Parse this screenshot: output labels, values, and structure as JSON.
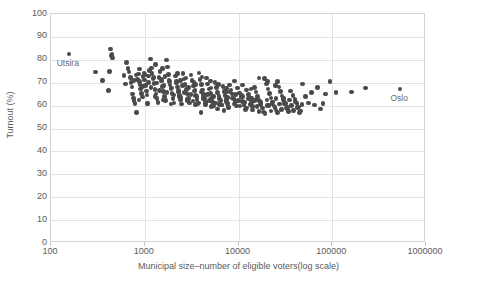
{
  "chart_data": {
    "type": "scatter",
    "title": "",
    "xlabel": "Municipal size–number of eligible voters(log scale)",
    "ylabel": "Turnout (%)",
    "xscale": "log",
    "yscale": "linear",
    "xlim": [
      100,
      1000000
    ],
    "ylim": [
      0,
      100
    ],
    "grid": true,
    "legend": null,
    "xticks": [
      100,
      1000,
      10000,
      100000,
      1000000
    ],
    "xtick_labels": [
      "100",
      "1000",
      "10000",
      "100000",
      "1000000"
    ],
    "yticks": [
      0,
      10,
      20,
      30,
      40,
      50,
      60,
      70,
      80,
      90,
      100
    ],
    "ytick_labels": [
      "0",
      "10",
      "20",
      "30",
      "40",
      "50",
      "60",
      "70",
      "80",
      "90",
      "100"
    ],
    "marker_color": "#4a4a4a",
    "marker_size": 4.6,
    "annotations": [
      {
        "text": "Utsira",
        "x": 155,
        "y": 82.5,
        "label_dx": 0,
        "label_dy": -9
      },
      {
        "text": "Oslo",
        "x": 530000,
        "y": 67.3,
        "label_dx": 0,
        "label_dy": -9
      }
    ],
    "series": [
      {
        "name": "Norwegian municipalities",
        "points": [
          [
            155,
            82.5
          ],
          [
            300,
            74.7
          ],
          [
            355,
            70.9
          ],
          [
            408,
            66.6
          ],
          [
            420,
            74.9
          ],
          [
            430,
            84.8
          ],
          [
            440,
            81.9
          ],
          [
            448,
            82.6
          ],
          [
            455,
            80.8
          ],
          [
            600,
            73.1
          ],
          [
            625,
            69.5
          ],
          [
            640,
            78.8
          ],
          [
            660,
            76.1
          ],
          [
            680,
            74.6
          ],
          [
            700,
            72.3
          ],
          [
            715,
            70.2
          ],
          [
            730,
            68.1
          ],
          [
            745,
            65.0
          ],
          [
            760,
            63.4
          ],
          [
            770,
            62.1
          ],
          [
            790,
            60.9
          ],
          [
            820,
            57.1
          ],
          [
            840,
            71.5
          ],
          [
            860,
            73.8
          ],
          [
            875,
            75.9
          ],
          [
            890,
            69.3
          ],
          [
            905,
            67.2
          ],
          [
            920,
            65.4
          ],
          [
            940,
            63.8
          ],
          [
            960,
            72.6
          ],
          [
            980,
            74.3
          ],
          [
            1000,
            71.1
          ],
          [
            1020,
            68.9
          ],
          [
            1040,
            66.3
          ],
          [
            1060,
            64.7
          ],
          [
            1080,
            61.0
          ],
          [
            1100,
            73.0
          ],
          [
            1120,
            75.2
          ],
          [
            1150,
            80.3
          ],
          [
            1180,
            76.4
          ],
          [
            1200,
            74.0
          ],
          [
            1230,
            71.8
          ],
          [
            1260,
            69.6
          ],
          [
            1290,
            67.0
          ],
          [
            1320,
            65.1
          ],
          [
            1350,
            63.2
          ],
          [
            1380,
            61.4
          ],
          [
            1420,
            72.2
          ],
          [
            1460,
            74.8
          ],
          [
            1500,
            70.7
          ],
          [
            1540,
            68.3
          ],
          [
            1580,
            66.1
          ],
          [
            1620,
            64.0
          ],
          [
            1660,
            62.3
          ],
          [
            1700,
            79.9
          ],
          [
            1740,
            76.8
          ],
          [
            1780,
            73.5
          ],
          [
            1820,
            71.2
          ],
          [
            1860,
            69.0
          ],
          [
            1900,
            67.3
          ],
          [
            1950,
            65.2
          ],
          [
            2000,
            63.0
          ],
          [
            2060,
            61.1
          ],
          [
            2120,
            72.9
          ],
          [
            2180,
            70.4
          ],
          [
            2240,
            68.2
          ],
          [
            2300,
            66.0
          ],
          [
            2360,
            64.3
          ],
          [
            2420,
            62.5
          ],
          [
            2480,
            60.7
          ],
          [
            2550,
            74.1
          ],
          [
            2620,
            71.6
          ],
          [
            2700,
            69.2
          ],
          [
            2780,
            67.1
          ],
          [
            2860,
            65.0
          ],
          [
            2940,
            63.1
          ],
          [
            3020,
            61.2
          ],
          [
            3100,
            73.3
          ],
          [
            3200,
            70.9
          ],
          [
            3300,
            68.5
          ],
          [
            3400,
            66.4
          ],
          [
            3500,
            64.5
          ],
          [
            3600,
            62.7
          ],
          [
            3700,
            60.9
          ],
          [
            3800,
            74.2
          ],
          [
            3900,
            71.3
          ],
          [
            4000,
            57.0
          ],
          [
            4050,
            69.1
          ],
          [
            4150,
            66.8
          ],
          [
            4250,
            64.9
          ],
          [
            4350,
            63.0
          ],
          [
            4450,
            61.3
          ],
          [
            4550,
            72.0
          ],
          [
            4700,
            69.4
          ],
          [
            4850,
            67.2
          ],
          [
            5000,
            65.3
          ],
          [
            5150,
            63.4
          ],
          [
            5300,
            61.6
          ],
          [
            5450,
            59.9
          ],
          [
            5600,
            70.1
          ],
          [
            5800,
            67.9
          ],
          [
            6000,
            65.8
          ],
          [
            6200,
            63.9
          ],
          [
            6400,
            62.1
          ],
          [
            6600,
            60.3
          ],
          [
            6800,
            68.3
          ],
          [
            7000,
            66.2
          ],
          [
            7200,
            64.4
          ],
          [
            7400,
            62.6
          ],
          [
            7600,
            60.8
          ],
          [
            7800,
            59.1
          ],
          [
            8000,
            69.0
          ],
          [
            8300,
            66.9
          ],
          [
            8600,
            65.0
          ],
          [
            8900,
            63.2
          ],
          [
            9200,
            61.5
          ],
          [
            9500,
            59.8
          ],
          [
            9800,
            67.6
          ],
          [
            10200,
            65.5
          ],
          [
            10600,
            63.7
          ],
          [
            11000,
            61.9
          ],
          [
            11400,
            60.2
          ],
          [
            11800,
            58.4
          ],
          [
            12200,
            66.8
          ],
          [
            12700,
            64.8
          ],
          [
            13200,
            63.0
          ],
          [
            13700,
            61.3
          ],
          [
            14200,
            59.6
          ],
          [
            14800,
            68.0
          ],
          [
            15400,
            65.9
          ],
          [
            16000,
            64.1
          ],
          [
            16600,
            62.3
          ],
          [
            17200,
            60.6
          ],
          [
            17800,
            58.9
          ],
          [
            18400,
            57.2
          ],
          [
            19000,
            71.8
          ],
          [
            19800,
            69.5
          ],
          [
            20600,
            67.3
          ],
          [
            21400,
            65.2
          ],
          [
            22200,
            63.3
          ],
          [
            23000,
            61.5
          ],
          [
            24000,
            59.8
          ],
          [
            25000,
            58.1
          ],
          [
            26000,
            70.4
          ],
          [
            27000,
            68.2
          ],
          [
            28000,
            66.1
          ],
          [
            29000,
            64.2
          ],
          [
            30000,
            62.4
          ],
          [
            31000,
            60.7
          ],
          [
            32500,
            59.0
          ],
          [
            34000,
            57.4
          ],
          [
            36000,
            66.4
          ],
          [
            38000,
            64.5
          ],
          [
            40000,
            62.7
          ],
          [
            42000,
            61.0
          ],
          [
            44000,
            59.3
          ],
          [
            46000,
            57.6
          ],
          [
            48000,
            69.4
          ],
          [
            52000,
            63.9
          ],
          [
            56000,
            61.2
          ],
          [
            60000,
            65.8
          ],
          [
            65000,
            60.3
          ],
          [
            70000,
            67.9
          ],
          [
            75000,
            58.5
          ],
          [
            80000,
            60.8
          ],
          [
            85000,
            65.1
          ],
          [
            95000,
            70.4
          ],
          [
            110000,
            65.8
          ],
          [
            160000,
            65.9
          ],
          [
            225000,
            67.7
          ],
          [
            530000,
            67.3
          ],
          [
            760,
            71.0
          ],
          [
            810,
            73.4
          ],
          [
            880,
            70.6
          ],
          [
            950,
            68.4
          ],
          [
            1010,
            73.7
          ],
          [
            1090,
            70.0
          ],
          [
            1170,
            67.9
          ],
          [
            1250,
            72.4
          ],
          [
            1340,
            69.9
          ],
          [
            1430,
            66.6
          ],
          [
            1520,
            71.7
          ],
          [
            1610,
            68.7
          ],
          [
            1720,
            65.6
          ],
          [
            1830,
            70.5
          ],
          [
            1940,
            67.6
          ],
          [
            2050,
            64.6
          ],
          [
            2170,
            69.8
          ],
          [
            2290,
            66.5
          ],
          [
            2410,
            63.6
          ],
          [
            2540,
            68.8
          ],
          [
            2670,
            65.7
          ],
          [
            2810,
            62.9
          ],
          [
            2950,
            67.8
          ],
          [
            3110,
            64.8
          ],
          [
            3270,
            62.0
          ],
          [
            3440,
            66.9
          ],
          [
            3610,
            64.0
          ],
          [
            3800,
            61.1
          ],
          [
            4000,
            65.9
          ],
          [
            4200,
            63.1
          ],
          [
            4420,
            60.4
          ],
          [
            4650,
            64.9
          ],
          [
            4890,
            62.2
          ],
          [
            5140,
            59.5
          ],
          [
            5410,
            63.9
          ],
          [
            5690,
            61.2
          ],
          [
            5990,
            58.6
          ],
          [
            6300,
            62.9
          ],
          [
            6620,
            60.3
          ],
          [
            6970,
            57.8
          ],
          [
            7330,
            61.9
          ],
          [
            7710,
            59.4
          ],
          [
            8110,
            66.0
          ],
          [
            8530,
            63.3
          ],
          [
            8970,
            60.7
          ],
          [
            9440,
            64.9
          ],
          [
            9930,
            62.3
          ],
          [
            10400,
            59.8
          ],
          [
            11000,
            64.0
          ],
          [
            11600,
            61.4
          ],
          [
            12200,
            58.9
          ],
          [
            12800,
            63.1
          ],
          [
            13500,
            60.6
          ],
          [
            14200,
            58.1
          ],
          [
            14900,
            62.2
          ],
          [
            15700,
            59.7
          ],
          [
            16500,
            57.3
          ],
          [
            17400,
            61.4
          ],
          [
            18300,
            58.9
          ],
          [
            19200,
            56.6
          ],
          [
            20200,
            62.5
          ],
          [
            21200,
            60.0
          ],
          [
            22300,
            57.7
          ],
          [
            23400,
            61.6
          ],
          [
            24600,
            59.2
          ],
          [
            25900,
            56.9
          ],
          [
            27200,
            60.7
          ],
          [
            28600,
            58.3
          ],
          [
            30100,
            63.3
          ],
          [
            31600,
            60.9
          ],
          [
            33200,
            58.6
          ],
          [
            35000,
            62.4
          ],
          [
            36800,
            60.1
          ],
          [
            38700,
            57.8
          ],
          [
            40700,
            61.5
          ],
          [
            42800,
            59.2
          ],
          [
            45000,
            57.0
          ],
          [
            47400,
            60.6
          ],
          [
            1300,
            78.0
          ],
          [
            1550,
            76.2
          ],
          [
            2250,
            73.9
          ],
          [
            2750,
            72.1
          ],
          [
            3350,
            70.2
          ],
          [
            4100,
            72.5
          ],
          [
            5000,
            70.8
          ],
          [
            6100,
            69.1
          ],
          [
            7450,
            67.4
          ],
          [
            9100,
            70.7
          ],
          [
            11100,
            69.0
          ],
          [
            13600,
            67.2
          ],
          [
            16600,
            72.1
          ],
          [
            20300,
            70.5
          ],
          [
            24800,
            68.8
          ],
          [
            1650,
            72.8
          ],
          [
            2400,
            71.0
          ],
          [
            3500,
            69.3
          ],
          [
            5100,
            67.6
          ],
          [
            7400,
            66.0
          ],
          [
            10800,
            64.3
          ],
          [
            15700,
            62.6
          ],
          [
            22800,
            61.0
          ],
          [
            33100,
            59.3
          ],
          [
            870,
            62.5
          ],
          [
            1060,
            60.8
          ],
          [
            1290,
            64.1
          ],
          [
            1570,
            62.4
          ],
          [
            1910,
            60.7
          ],
          [
            2330,
            63.9
          ],
          [
            2840,
            62.2
          ],
          [
            3460,
            60.5
          ],
          [
            4220,
            63.8
          ],
          [
            5140,
            62.1
          ],
          [
            6270,
            60.4
          ],
          [
            7640,
            63.6
          ],
          [
            9320,
            61.9
          ],
          [
            11400,
            60.2
          ],
          [
            13800,
            63.4
          ],
          [
            16900,
            61.7
          ],
          [
            20500,
            60.0
          ],
          [
            25100,
            63.2
          ],
          [
            30500,
            61.5
          ]
        ]
      }
    ]
  },
  "axes": {
    "x_title": "Municipal size–number of eligible voters(log scale)",
    "y_title": "Turnout (%)"
  }
}
